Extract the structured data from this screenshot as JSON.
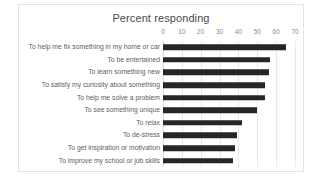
{
  "chart_data": {
    "type": "bar",
    "orientation": "horizontal",
    "title": "Percent responding",
    "xlabel": "",
    "ylabel": "",
    "xlim": [
      0,
      70
    ],
    "xticks": [
      0,
      10,
      20,
      30,
      40,
      50,
      60,
      70
    ],
    "grid": true,
    "legend": false,
    "bar_color": "#262626",
    "grid_color": "#e8e8e8",
    "title_color": "#4a4a4a",
    "label_color": "#5e5e5e",
    "tick_color": "#8c8c8c",
    "border_color": "#e3e3e3",
    "categories": [
      "To help me fix something in my home or car",
      "To be entertained",
      "To learn something new",
      "To satisfy my curiosity about something",
      "To help me solve a problem",
      "To see something unique",
      "To relax",
      "To de-stress",
      "To get inspiration or motivation",
      "To improve my school or job skills"
    ],
    "values": [
      65,
      57,
      56,
      54,
      54,
      50,
      42,
      39,
      38,
      37
    ]
  }
}
